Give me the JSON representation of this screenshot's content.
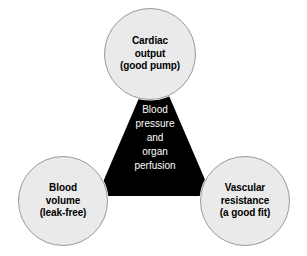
{
  "diagram": {
    "type": "venn-triad",
    "background_color": "#ffffff",
    "triangle": {
      "name": "central-triangle",
      "fill_color": "#000000",
      "text_color": "#ffffff",
      "lines": [
        "Blood",
        "pressure",
        "and",
        "organ",
        "perfusion"
      ],
      "text_full": "Blood pressure and organ perfusion"
    },
    "nodes": [
      {
        "id": "cardiac-output",
        "position": "top",
        "fill_color": "#eaeaea",
        "border_color": "#9a9a9a",
        "text_color": "#000000",
        "lines": [
          "Cardiac",
          "output",
          "(good pump)"
        ],
        "text_full": "Cardiac output (good pump)"
      },
      {
        "id": "blood-volume",
        "position": "bottom-left",
        "fill_color": "#eaeaea",
        "border_color": "#9a9a9a",
        "text_color": "#000000",
        "lines": [
          "Blood",
          "volume",
          "(leak-free)"
        ],
        "text_full": "Blood volume (leak-free)"
      },
      {
        "id": "vascular-resistance",
        "position": "bottom-right",
        "fill_color": "#eaeaea",
        "border_color": "#9a9a9a",
        "text_color": "#000000",
        "lines": [
          "Vascular",
          "resistance",
          "(a good fit)"
        ],
        "text_full": "Vascular resistance (a good fit)"
      }
    ]
  }
}
